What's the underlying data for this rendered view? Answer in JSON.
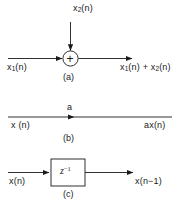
{
  "figure": {
    "stroke_color": "#1a1a1a",
    "background_color": "#ffffff"
  },
  "blocks": [
    {
      "id": "adder",
      "caption": "(a)",
      "operator_symbol": "+",
      "inputs": [
        {
          "name": "vertical-input",
          "label_text": "x",
          "label_sub": "2",
          "label_tail": "(n)"
        },
        {
          "name": "horizontal-input",
          "label_text": "x",
          "label_sub": "1",
          "label_tail": "(n)"
        }
      ],
      "output": {
        "name": "sum-output",
        "label_full": "x₁(n) + x₂(n)"
      }
    },
    {
      "id": "multiplier",
      "caption": "(b)",
      "gain_label": "a",
      "input_label": "x (n)",
      "output_label": "ax(n)"
    },
    {
      "id": "unit-delay",
      "caption": "(c)",
      "box_label_base": "z",
      "box_label_exp": "−1",
      "input_label": "x(n)",
      "output_label": "x(n−1)"
    }
  ],
  "labels": {
    "a_x2n_base": "x",
    "a_x2n_sub": "2",
    "a_x2n_tail": "(n)",
    "a_x1n_base": "x",
    "a_x1n_sub": "1",
    "a_x1n_tail": "(n)",
    "a_out_base1": "x",
    "a_out_sub1": "1",
    "a_out_mid": "(n) + x",
    "a_out_sub2": "2",
    "a_out_tail": "(n)",
    "a_caption": "(a)",
    "a_plus": "+",
    "b_gain": "a",
    "b_in": "x (n)",
    "b_out": "ax(n)",
    "b_caption": "(b)",
    "c_z": "z",
    "c_z_exp": "−1",
    "c_in": "x(n)",
    "c_out": "x(n−1)",
    "c_caption": "(c)"
  }
}
